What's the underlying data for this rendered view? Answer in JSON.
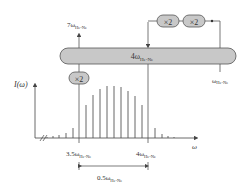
{
  "diagram": {
    "labels": {
      "top_output": "7ω",
      "top_output_sub": "He-Ne",
      "bar_label": "4ω",
      "bar_label_sub": "He-Ne",
      "doubler_left": "×2",
      "doubler_right_1": "×2",
      "doubler_right_2": "×2",
      "input_label": "ω",
      "input_label_sub": "He-Ne",
      "y_axis": "I(ω)",
      "x_axis": "ω",
      "tick_left": "3.5ω",
      "tick_left_sub": "He-Ne",
      "tick_right": "4ω",
      "tick_right_sub": "He-Ne",
      "span": "0.5ω",
      "span_sub": "He-Ne"
    },
    "colors": {
      "bar_fill": "#c8c8c8",
      "stroke": "#555555",
      "spectral_line": "#555555"
    },
    "spectrum_lines": [
      {
        "x": 47,
        "h": 1
      },
      {
        "x": 53,
        "h": 2
      },
      {
        "x": 59,
        "h": 3
      },
      {
        "x": 66,
        "h": 5
      },
      {
        "x": 73,
        "h": 10
      },
      {
        "x": 86,
        "h": 33
      },
      {
        "x": 93,
        "h": 43
      },
      {
        "x": 100,
        "h": 49
      },
      {
        "x": 107,
        "h": 52
      },
      {
        "x": 114,
        "h": 52
      },
      {
        "x": 121,
        "h": 51
      },
      {
        "x": 128,
        "h": 47
      },
      {
        "x": 135,
        "h": 42
      },
      {
        "x": 142,
        "h": 33
      },
      {
        "x": 155,
        "h": 10
      },
      {
        "x": 162,
        "h": 4
      },
      {
        "x": 168,
        "h": 2
      },
      {
        "x": 174,
        "h": 1
      }
    ]
  }
}
